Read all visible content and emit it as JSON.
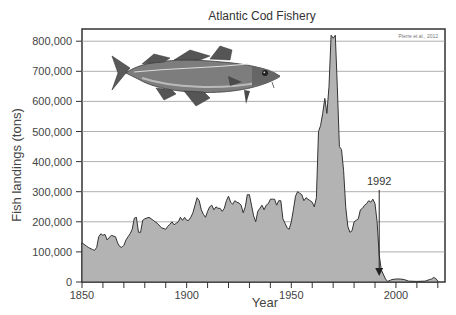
{
  "chart_data": {
    "type": "area",
    "title": "Atlantic Cod Fishery",
    "xlabel": "Year",
    "ylabel": "Fish landings (tons)",
    "source_note": "Pierre et al., 2012",
    "xlim": [
      1850,
      2023
    ],
    "ylim": [
      0,
      830000
    ],
    "x_ticks": [
      1850,
      1900,
      1950,
      2000
    ],
    "x_minor_tick_step": 10,
    "y_ticks": [
      0,
      100000,
      200000,
      300000,
      400000,
      500000,
      600000,
      700000,
      800000
    ],
    "y_tick_labels": [
      "0",
      "100,000",
      "200,000",
      "300,000",
      "400,000",
      "500,000",
      "600,000",
      "700,000",
      "800,000"
    ],
    "grid": "horizontal",
    "legend": "none",
    "annotations": [
      {
        "text": "1992",
        "x": 1992,
        "arrow_to_y": 20000,
        "label_y": 330000
      }
    ],
    "image": "atlantic-cod-illustration",
    "series": [
      {
        "name": "Fish landings",
        "x": [
          1850,
          1852,
          1853,
          1855,
          1856,
          1857,
          1858,
          1859,
          1860,
          1861,
          1862,
          1864,
          1866,
          1867,
          1868,
          1869,
          1870,
          1871,
          1872,
          1873,
          1874,
          1875,
          1876,
          1877,
          1878,
          1879,
          1880,
          1882,
          1884,
          1886,
          1888,
          1890,
          1891,
          1892,
          1893,
          1894,
          1895,
          1896,
          1897,
          1898,
          1899,
          1900,
          1901,
          1902,
          1903,
          1904,
          1905,
          1906,
          1907,
          1908,
          1909,
          1910,
          1911,
          1912,
          1913,
          1914,
          1915,
          1916,
          1917,
          1918,
          1919,
          1920,
          1921,
          1922,
          1923,
          1924,
          1925,
          1926,
          1927,
          1928,
          1929,
          1930,
          1931,
          1932,
          1933,
          1934,
          1935,
          1936,
          1937,
          1938,
          1939,
          1940,
          1941,
          1942,
          1943,
          1944,
          1945,
          1946,
          1947,
          1948,
          1949,
          1950,
          1951,
          1952,
          1953,
          1954,
          1955,
          1956,
          1957,
          1958,
          1959,
          1960,
          1961,
          1962,
          1963,
          1964,
          1965,
          1966,
          1967,
          1968,
          1969,
          1970,
          1971,
          1972,
          1973,
          1974,
          1975,
          1976,
          1977,
          1978,
          1979,
          1980,
          1981,
          1982,
          1983,
          1984,
          1985,
          1986,
          1987,
          1988,
          1989,
          1990,
          1991,
          1992,
          1993,
          1995,
          1996,
          1998,
          2000,
          2002,
          2004,
          2006,
          2010,
          2014,
          2016,
          2017,
          2018,
          2019,
          2020
        ],
        "values": [
          130000,
          120000,
          115000,
          108000,
          105000,
          115000,
          150000,
          160000,
          155000,
          158000,
          140000,
          155000,
          150000,
          130000,
          118000,
          115000,
          122000,
          140000,
          150000,
          160000,
          175000,
          212000,
          215000,
          165000,
          165000,
          205000,
          210000,
          215000,
          205000,
          195000,
          180000,
          175000,
          185000,
          192000,
          200000,
          190000,
          195000,
          200000,
          215000,
          205000,
          215000,
          205000,
          205000,
          215000,
          230000,
          255000,
          280000,
          270000,
          240000,
          225000,
          215000,
          235000,
          250000,
          255000,
          240000,
          250000,
          245000,
          245000,
          235000,
          245000,
          270000,
          285000,
          265000,
          258000,
          270000,
          265000,
          262000,
          255000,
          230000,
          250000,
          290000,
          290000,
          255000,
          220000,
          200000,
          235000,
          245000,
          255000,
          240000,
          255000,
          260000,
          275000,
          275000,
          275000,
          255000,
          270000,
          270000,
          210000,
          195000,
          180000,
          175000,
          200000,
          240000,
          285000,
          300000,
          295000,
          290000,
          270000,
          280000,
          275000,
          270000,
          265000,
          250000,
          280000,
          500000,
          520000,
          560000,
          610000,
          560000,
          650000,
          820000,
          810000,
          820000,
          650000,
          450000,
          440000,
          370000,
          250000,
          185000,
          165000,
          170000,
          200000,
          205000,
          210000,
          240000,
          245000,
          255000,
          260000,
          270000,
          265000,
          275000,
          260000,
          200000,
          90000,
          40000,
          10000,
          2000,
          8000,
          10000,
          10000,
          8000,
          3000,
          2000,
          3000,
          8000,
          10000,
          15000,
          12000,
          3000
        ]
      }
    ]
  }
}
